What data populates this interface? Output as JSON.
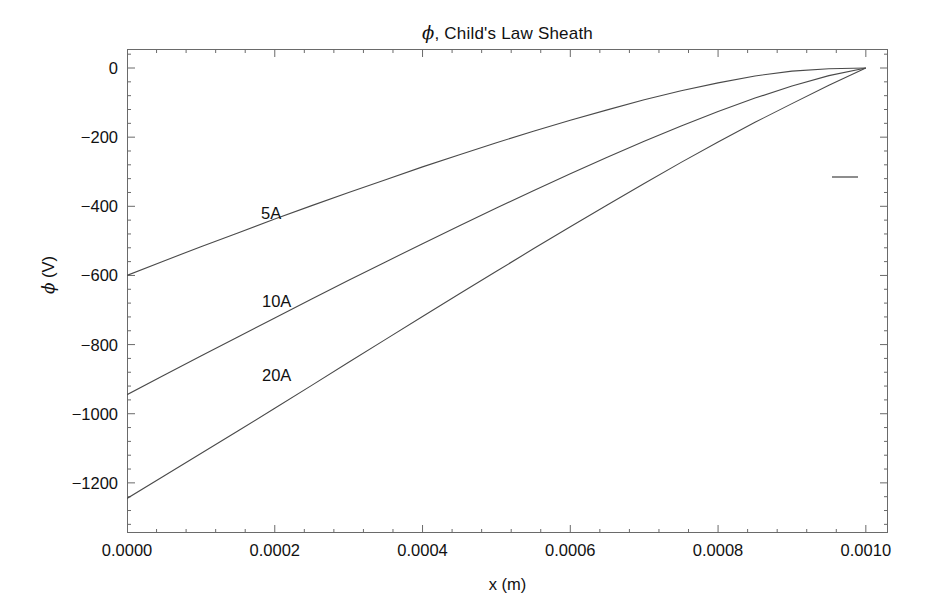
{
  "chart_data": {
    "type": "line",
    "title": "ϕ, Child's Law Sheath",
    "title_plain": ", Child's Law Sheath",
    "xlabel": "x (m)",
    "ylabel": "ϕ (V)",
    "ylabel_plain": " (V)",
    "xlim": [
      0.0,
      0.00103
    ],
    "ylim": [
      -1345,
      55
    ],
    "grid": false,
    "legend": "inline-annotations",
    "xticks": [
      0.0,
      0.0002,
      0.0004,
      0.0006,
      0.0008,
      0.001
    ],
    "xtick_labels": [
      "0.0000",
      "0.0002",
      "0.0004",
      "0.0006",
      "0.0008",
      "0.0010"
    ],
    "yticks": [
      0,
      -200,
      -400,
      -600,
      -800,
      -1000,
      -1200
    ],
    "ytick_labels": [
      "0",
      "−200",
      "−400",
      "−600",
      "−800",
      "−1000",
      "−1200"
    ],
    "minor_tick_subdivisions": 5,
    "x": [
      0.0,
      5e-05,
      0.0001,
      0.00015,
      0.0002,
      0.00025,
      0.0003,
      0.00035,
      0.0004,
      0.00045,
      0.0005,
      0.00055,
      0.0006,
      0.00065,
      0.0007,
      0.00075,
      0.0008,
      0.00085,
      0.0009,
      0.00095,
      0.001
    ],
    "series": [
      {
        "name": "5A",
        "label": "5A",
        "current_amps": 5,
        "color": "#4a4a4a",
        "y": [
          -600,
          -558,
          -517,
          -477,
          -437,
          -398,
          -360,
          -323,
          -286,
          -251,
          -216,
          -183,
          -151,
          -121,
          -92,
          -66,
          -43,
          -23,
          -9,
          -2,
          0
        ]
      },
      {
        "name": "10A",
        "label": "10A",
        "current_amps": 10,
        "color": "#4a4a4a",
        "y": [
          -945,
          -889,
          -833,
          -778,
          -723,
          -668,
          -614,
          -561,
          -508,
          -456,
          -405,
          -355,
          -306,
          -258,
          -212,
          -168,
          -126,
          -87,
          -52,
          -22,
          0
        ]
      },
      {
        "name": "20A",
        "label": "20A",
        "current_amps": 20,
        "color": "#4a4a4a",
        "y": [
          -1245,
          -1180,
          -1115,
          -1050,
          -984,
          -918,
          -851,
          -785,
          -719,
          -653,
          -588,
          -523,
          -459,
          -396,
          -334,
          -273,
          -214,
          -157,
          -103,
          -50,
          0
        ]
      }
    ],
    "annotations": [
      {
        "text": "5A",
        "x": 0.00018,
        "y": -430
      },
      {
        "text": "10A",
        "x": 0.00018,
        "y": -690
      },
      {
        "text": "20A",
        "x": 0.00018,
        "y": -895
      }
    ]
  },
  "figure": {
    "title": "ϕ, Child's Law Sheath",
    "axis_color": "#6a6a6a",
    "curve_color": "#4a4a4a",
    "background": "#ffffff"
  }
}
